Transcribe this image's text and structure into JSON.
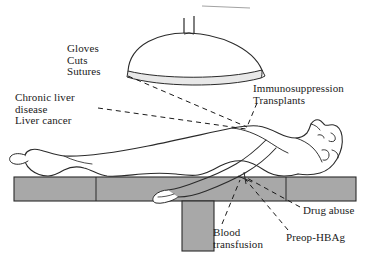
{
  "diagram": {
    "background_color": "#ffffff",
    "ink_color": "#1a1a1a",
    "table_fill": "#a8a8a8",
    "lamp_band_fill": "#e8e8e8",
    "labels": {
      "gloves": "Gloves\nCuts\nSutures",
      "chronic_liver": "Chronic liver\ndisease\nLiver cancer",
      "immunosuppression": "Immunosuppression\nTransplants",
      "drug_abuse": "Drug abuse",
      "preop_hbag": "Preop-HBAg",
      "blood_transfusion": "Blood\ntransfusion"
    },
    "elements": {
      "surgical_lamp": "surgical-lamp",
      "lamp_stem": "lamp-stem",
      "patient": "patient-body",
      "operating_table": "operating-table",
      "table_leg": "table-leg"
    }
  }
}
